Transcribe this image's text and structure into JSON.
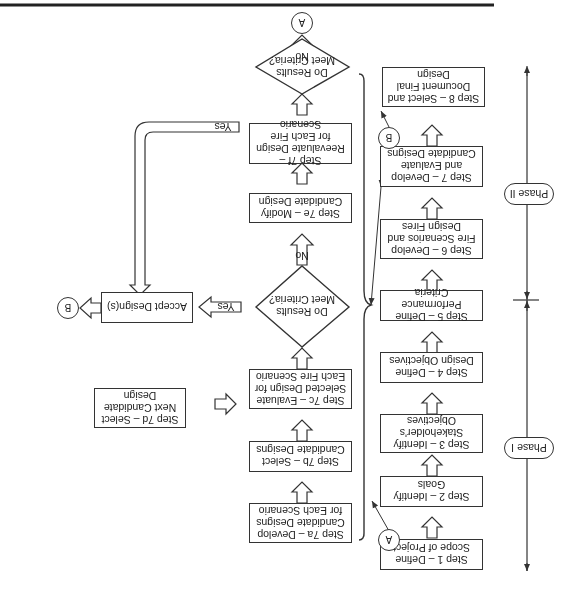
{
  "diagram": {
    "orientation": "rotated 180 degrees",
    "phases": {
      "phase1": "Phase I",
      "phase2": "Phase II"
    },
    "main_steps": [
      {
        "id": "step1",
        "label": "Step 1 – Define Scope of Project"
      },
      {
        "id": "step2",
        "label": "Step 2 – Identify Goals"
      },
      {
        "id": "step3",
        "label": "Step 3 – Identify Stakeholder's Objectives"
      },
      {
        "id": "step4",
        "label": "Step 4 – Define Design Objectives"
      },
      {
        "id": "step5",
        "label": "Step 5 – Define Performance Criteria"
      },
      {
        "id": "step6",
        "label": "Step 6 – Develop Fire Scenarios and Design Fires"
      },
      {
        "id": "step7",
        "label": "Step 7 – Develop and Evaluate Candidate Designs"
      },
      {
        "id": "step8",
        "label": "Step 8 – Select and Document Final Design"
      }
    ],
    "sub_steps": {
      "step7a": "Step 7a – Develop Candidate Designs for Each Scenario",
      "step7b": "Step 7b – Select Candidate Designs",
      "step7c": "Step 7c – Evaluate Selected Design for Each Fire Scenario",
      "step7d": "Step 7d – Select Next Candidate Design",
      "step7e": "Step 7e – Modify Candidate Design",
      "step7f": "Step 7f – Reevaluate Design for Each Fire Scenario",
      "accept": "Accept Design(s)"
    },
    "decisions": {
      "decision1": "Do Results Meet Criteria?",
      "decision2": "Do Results Meet Criteria?"
    },
    "arrow_labels": {
      "yes1": "Yes",
      "no1": "No",
      "yes2": "Yes",
      "no2": "No"
    },
    "connectors": {
      "a_start": "A",
      "a_end": "A",
      "b_start": "B",
      "b_end": "B"
    }
  }
}
